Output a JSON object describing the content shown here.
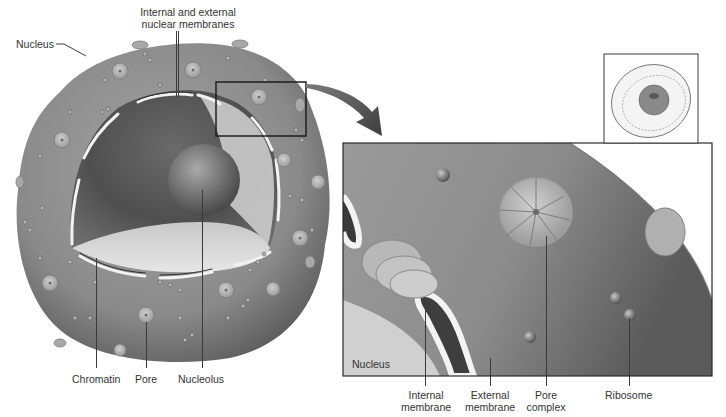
{
  "figure": {
    "left_labels": {
      "top": "Internal and external\nnuclear membranes",
      "top_line1": "Internal and external",
      "top_line2": "nuclear membranes",
      "nucleus": "Nucleus",
      "chromatin": "Chromatin",
      "pore": "Pore",
      "nucleolus": "Nucleolus"
    },
    "detail_labels": {
      "nucleus": "Nucleus",
      "internal_membrane_1": "Internal",
      "internal_membrane_2": "membrane",
      "external_membrane_1": "External",
      "external_membrane_2": "membrane",
      "pore_complex_1": "Pore",
      "pore_complex_2": "complex",
      "ribosome": "Ribosome"
    },
    "inset": {
      "description": "Cell overview thumbnail highlighting nucleus"
    },
    "colors": {
      "nucleus_surface": "#8a8a8a",
      "nucleus_dark": "#5a5a5a",
      "interior_light": "#d8d8d8",
      "membrane_white": "#f2f2f2",
      "frame": "#2a2a2a",
      "text": "#333333"
    }
  }
}
